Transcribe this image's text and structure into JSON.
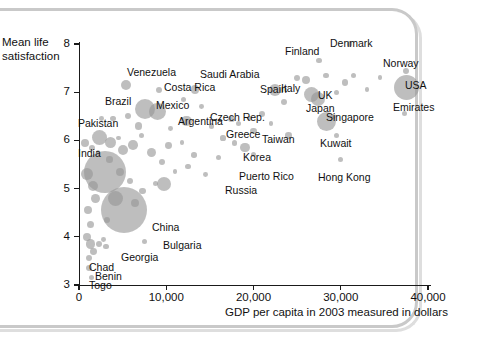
{
  "figure": {
    "background": "#ffffff",
    "frame_color": "#c9c9c9",
    "bubble_color": "#969696"
  },
  "chart_data": {
    "type": "scatter",
    "title": "",
    "subtitle": "",
    "xlabel": "GDP per capita in 2003 measured in dollars",
    "ylabel": "Mean life satisfaction",
    "ylabel_line1": "Mean life",
    "ylabel_line2": "satisfaction",
    "xlim": [
      0,
      42000
    ],
    "ylim": [
      3,
      8.2
    ],
    "grid": false,
    "legend": "none",
    "size_encoding": "population",
    "xticks": [
      0,
      10000,
      20000,
      30000,
      40000
    ],
    "xtick_labels": [
      "0",
      "10,000",
      "20,000",
      "30,000",
      "40,000"
    ],
    "yticks": [
      3,
      4,
      5,
      6,
      7,
      8
    ],
    "ytick_labels": [
      "3",
      "4",
      "5",
      "6",
      "7",
      "8"
    ],
    "points": [
      {
        "label": "Venezuela",
        "x": 5400,
        "y": 7.15,
        "r": 5.0,
        "lx": 127,
        "ly": 67
      },
      {
        "label": "Costa Rica",
        "x": 9200,
        "y": 7.05,
        "r": 3.2,
        "lx": 164,
        "ly": 82
      },
      {
        "label": "Brazil",
        "x": 7600,
        "y": 6.65,
        "r": 10.0,
        "lx": 105,
        "ly": 96
      },
      {
        "label": "Mexico",
        "x": 9000,
        "y": 6.6,
        "r": 8.5,
        "lx": 156,
        "ly": 100
      },
      {
        "label": "Saudi Arabia",
        "x": 13300,
        "y": 7.05,
        "r": 4.3,
        "lx": 200,
        "ly": 69
      },
      {
        "label": "Spain",
        "x": 22500,
        "y": 7.05,
        "r": 6.0,
        "lx": 260,
        "ly": 84
      },
      {
        "label": "Italy",
        "x": 26600,
        "y": 6.95,
        "r": 7.5,
        "lx": 281,
        "ly": 83
      },
      {
        "label": "Finland",
        "x": 27500,
        "y": 7.65,
        "r": 2.6,
        "lx": 285,
        "ly": 46
      },
      {
        "label": "Denmark",
        "x": 31000,
        "y": 8.0,
        "r": 2.6,
        "lx": 330,
        "ly": 38
      },
      {
        "label": "Norway",
        "x": 37500,
        "y": 7.45,
        "r": 3.0,
        "lx": 383,
        "ly": 58
      },
      {
        "label": "USA",
        "x": 37500,
        "y": 7.1,
        "r": 12.5,
        "lx": 405,
        "ly": 80
      },
      {
        "label": "Emirates",
        "x": 37300,
        "y": 6.55,
        "r": 2.6,
        "lx": 393,
        "ly": 102
      },
      {
        "label": "UK",
        "x": 27400,
        "y": 6.85,
        "r": 7.0,
        "lx": 318,
        "ly": 90
      },
      {
        "label": "Japan",
        "x": 28400,
        "y": 6.4,
        "r": 9.5,
        "lx": 306,
        "ly": 103
      },
      {
        "label": "Singapore",
        "x": 29200,
        "y": 6.5,
        "r": 2.6,
        "lx": 326,
        "ly": 112
      },
      {
        "label": "Czech Rep.",
        "x": 17500,
        "y": 6.45,
        "r": 3.2,
        "lx": 210,
        "ly": 112
      },
      {
        "label": "Argentina",
        "x": 12300,
        "y": 6.4,
        "r": 5.2,
        "lx": 178,
        "ly": 116
      },
      {
        "label": "Greece",
        "x": 20000,
        "y": 6.2,
        "r": 3.2,
        "lx": 226,
        "ly": 129
      },
      {
        "label": "Taiwan",
        "x": 24000,
        "y": 6.1,
        "r": 3.2,
        "lx": 262,
        "ly": 134
      },
      {
        "label": "Korea",
        "x": 19000,
        "y": 5.85,
        "r": 4.8,
        "lx": 243,
        "ly": 152
      },
      {
        "label": "Kuwait",
        "x": 29500,
        "y": 6.1,
        "r": 2.6,
        "lx": 320,
        "ly": 138
      },
      {
        "label": "Puerto Rico",
        "x": 20000,
        "y": 5.7,
        "r": 2.6,
        "lx": 239,
        "ly": 171
      },
      {
        "label": "Hong Kong",
        "x": 30000,
        "y": 5.6,
        "r": 2.6,
        "lx": 318,
        "ly": 172
      },
      {
        "label": "Russia",
        "x": 9700,
        "y": 5.1,
        "r": 7.0,
        "lx": 225,
        "ly": 185
      },
      {
        "label": "Pakistan",
        "x": 2300,
        "y": 6.05,
        "r": 7.5,
        "lx": 78,
        "ly": 118
      },
      {
        "label": "India",
        "x": 3000,
        "y": 5.35,
        "r": 21.0,
        "lx": 78,
        "ly": 148
      },
      {
        "label": "China",
        "x": 5200,
        "y": 4.55,
        "r": 23.0,
        "lx": 152,
        "ly": 222
      },
      {
        "label": "Bulgaria",
        "x": 7500,
        "y": 3.9,
        "r": 2.6,
        "lx": 163,
        "ly": 240
      },
      {
        "label": "Georgia",
        "x": 3100,
        "y": 3.8,
        "r": 2.6,
        "lx": 121,
        "ly": 252
      },
      {
        "label": "Chad",
        "x": 1100,
        "y": 3.55,
        "r": 3.0,
        "lx": 89,
        "ly": 262
      },
      {
        "label": "Benin",
        "x": 1200,
        "y": 3.35,
        "r": 3.0,
        "lx": 95,
        "ly": 271
      },
      {
        "label": "Togo",
        "x": 1400,
        "y": 3.15,
        "r": 2.6,
        "lx": 89,
        "ly": 280
      }
    ],
    "unlabeled_bubbles": [
      {
        "x": 700,
        "y": 5.95,
        "r": 4.0
      },
      {
        "x": 1500,
        "y": 5.85,
        "r": 3.0
      },
      {
        "x": 2200,
        "y": 5.75,
        "r": 2.2
      },
      {
        "x": 3600,
        "y": 5.95,
        "r": 5.5
      },
      {
        "x": 4500,
        "y": 6.05,
        "r": 2.4
      },
      {
        "x": 5100,
        "y": 5.8,
        "r": 5.0
      },
      {
        "x": 6200,
        "y": 5.9,
        "r": 4.8
      },
      {
        "x": 7200,
        "y": 6.1,
        "r": 2.6
      },
      {
        "x": 8300,
        "y": 5.75,
        "r": 4.6
      },
      {
        "x": 10300,
        "y": 5.9,
        "r": 3.4
      },
      {
        "x": 11800,
        "y": 5.95,
        "r": 2.4
      },
      {
        "x": 13200,
        "y": 5.7,
        "r": 2.8
      },
      {
        "x": 15200,
        "y": 6.3,
        "r": 2.8
      },
      {
        "x": 16500,
        "y": 6.05,
        "r": 2.6
      },
      {
        "x": 18300,
        "y": 6.35,
        "r": 2.8
      },
      {
        "x": 21000,
        "y": 6.55,
        "r": 3.0
      },
      {
        "x": 22000,
        "y": 6.35,
        "r": 2.4
      },
      {
        "x": 23500,
        "y": 6.8,
        "r": 3.0
      },
      {
        "x": 25000,
        "y": 7.3,
        "r": 3.2
      },
      {
        "x": 26000,
        "y": 7.25,
        "r": 4.2
      },
      {
        "x": 28300,
        "y": 7.35,
        "r": 2.6
      },
      {
        "x": 29500,
        "y": 7.0,
        "r": 2.6
      },
      {
        "x": 30500,
        "y": 7.2,
        "r": 3.2
      },
      {
        "x": 31500,
        "y": 7.35,
        "r": 2.6
      },
      {
        "x": 33000,
        "y": 7.05,
        "r": 2.4
      },
      {
        "x": 34500,
        "y": 7.3,
        "r": 2.4
      },
      {
        "x": 900,
        "y": 5.3,
        "r": 6.0
      },
      {
        "x": 1600,
        "y": 5.05,
        "r": 5.0
      },
      {
        "x": 1900,
        "y": 4.8,
        "r": 4.4
      },
      {
        "x": 1000,
        "y": 4.55,
        "r": 4.0
      },
      {
        "x": 1300,
        "y": 4.25,
        "r": 3.6
      },
      {
        "x": 900,
        "y": 4.0,
        "r": 4.2
      },
      {
        "x": 1300,
        "y": 3.85,
        "r": 4.6
      },
      {
        "x": 1700,
        "y": 3.7,
        "r": 3.4
      },
      {
        "x": 2300,
        "y": 3.85,
        "r": 3.0
      },
      {
        "x": 2800,
        "y": 3.95,
        "r": 2.4
      },
      {
        "x": 3200,
        "y": 4.35,
        "r": 3.2
      },
      {
        "x": 4200,
        "y": 4.8,
        "r": 7.5
      },
      {
        "x": 6400,
        "y": 4.7,
        "r": 4.0
      },
      {
        "x": 7300,
        "y": 4.95,
        "r": 3.2
      },
      {
        "x": 5900,
        "y": 5.15,
        "r": 3.0
      },
      {
        "x": 4700,
        "y": 5.35,
        "r": 4.0
      },
      {
        "x": 3500,
        "y": 5.6,
        "r": 3.2
      },
      {
        "x": 8800,
        "y": 5.1,
        "r": 2.6
      },
      {
        "x": 9500,
        "y": 5.55,
        "r": 3.0
      },
      {
        "x": 11000,
        "y": 5.35,
        "r": 2.4
      },
      {
        "x": 12500,
        "y": 5.45,
        "r": 2.6
      },
      {
        "x": 14500,
        "y": 5.3,
        "r": 2.4
      },
      {
        "x": 16000,
        "y": 5.65,
        "r": 2.6
      },
      {
        "x": 17800,
        "y": 5.95,
        "r": 2.8
      },
      {
        "x": 19500,
        "y": 6.45,
        "r": 2.4
      },
      {
        "x": 6800,
        "y": 6.3,
        "r": 3.8
      },
      {
        "x": 3900,
        "y": 6.45,
        "r": 2.6
      },
      {
        "x": 2600,
        "y": 6.45,
        "r": 2.4
      },
      {
        "x": 5600,
        "y": 6.5,
        "r": 3.0
      },
      {
        "x": 10500,
        "y": 6.25,
        "r": 2.4
      },
      {
        "x": 12000,
        "y": 6.85,
        "r": 2.6
      },
      {
        "x": 14000,
        "y": 6.7,
        "r": 2.4
      }
    ]
  }
}
